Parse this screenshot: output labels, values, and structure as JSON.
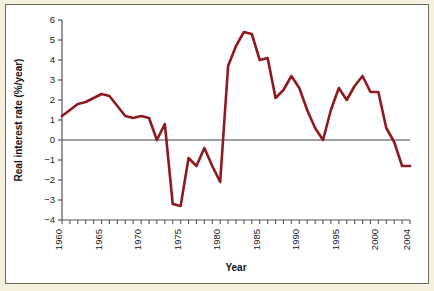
{
  "figure": {
    "background_color": "#f6f1df",
    "plot_background_color": "#ffffff",
    "frame_color": "#6f6a57"
  },
  "chart_data": {
    "type": "line",
    "title": "",
    "xlabel": "Year",
    "ylabel": "Real interest rate (%/year)",
    "xlim": [
      1960,
      2004
    ],
    "ylim": [
      -4,
      6
    ],
    "grid": false,
    "legend": null,
    "series_color": "#8e1a1f",
    "zero_line_color": "#808080",
    "axis_color": "#555555",
    "x_tick_interval": 1,
    "x_label_interval": 5,
    "y_tick_interval": 1,
    "xticklabels": [
      "1960",
      "1965",
      "1970",
      "1975",
      "1980",
      "1985",
      "1990",
      "1995",
      "2000",
      "2004"
    ],
    "xticklabel_values": [
      1960,
      1965,
      1970,
      1975,
      1980,
      1985,
      1990,
      1995,
      2000,
      2004
    ],
    "yticklabels": [
      "6",
      "5",
      "4",
      "3",
      "2",
      "1",
      "0",
      "−1",
      "−2",
      "−3",
      "−4"
    ],
    "yticklabel_values": [
      6,
      5,
      4,
      3,
      2,
      1,
      0,
      -1,
      -2,
      -3,
      -4
    ],
    "x": [
      1960,
      1961,
      1962,
      1963,
      1964,
      1965,
      1966,
      1967,
      1968,
      1969,
      1970,
      1971,
      1972,
      1973,
      1974,
      1975,
      1976,
      1977,
      1978,
      1979,
      1980,
      1981,
      1982,
      1983,
      1984,
      1985,
      1986,
      1987,
      1988,
      1989,
      1990,
      1991,
      1992,
      1993,
      1994,
      1995,
      1996,
      1997,
      1998,
      1999,
      2000,
      2001,
      2002,
      2003,
      2004
    ],
    "values": [
      1.2,
      1.5,
      1.8,
      1.9,
      2.1,
      2.3,
      2.2,
      1.7,
      1.2,
      1.1,
      1.2,
      1.1,
      0.0,
      0.8,
      -3.2,
      -3.3,
      -0.9,
      -1.3,
      -0.4,
      -1.3,
      -2.1,
      3.7,
      4.7,
      5.4,
      5.3,
      4.0,
      4.1,
      2.1,
      2.5,
      3.2,
      2.6,
      1.5,
      0.6,
      0.0,
      1.5,
      2.6,
      2.0,
      2.7,
      3.2,
      2.4,
      2.4,
      0.6,
      -0.1,
      -1.3,
      -1.3
    ]
  }
}
